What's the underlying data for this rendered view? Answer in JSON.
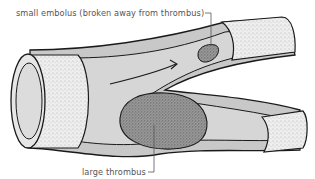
{
  "diagram": {
    "labels": {
      "embolus": "small embolus (broken away from thrombus)",
      "thrombus": "large thrombus"
    },
    "elements": [
      "blood vessel",
      "vessel wall",
      "blood flow arrow",
      "small embolus",
      "large thrombus",
      "branch"
    ],
    "colors": {
      "wall_fill": "#e6e6e6",
      "lumen_fill": "#d4d4d4",
      "clot_fill": "#8a8a8a",
      "outline": "#1a1a1a",
      "label_text": "#555555"
    }
  }
}
